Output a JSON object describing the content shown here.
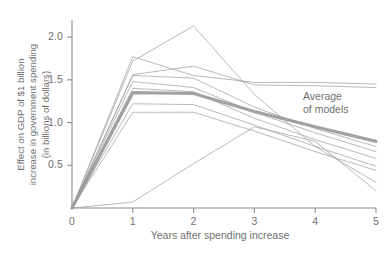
{
  "chart_data": {
    "type": "line",
    "title": "",
    "subtitle": "",
    "xlabel": "Years after spending increase",
    "ylabel": "Effect on GDP of $1 billion\nincrease in government spending\n(in billions of dollars)",
    "xlim": [
      0,
      5
    ],
    "ylim": [
      0,
      2.2
    ],
    "xticks": [
      "0",
      "1",
      "2",
      "3",
      "4",
      "5"
    ],
    "yticks": [
      "0.5",
      "1.0",
      "1.5",
      "2.0"
    ],
    "ytick_values": [
      0.5,
      1.0,
      1.5,
      2.0
    ],
    "xtick_values": [
      0,
      1,
      2,
      3,
      4,
      5
    ],
    "grid": false,
    "legend_position": "annotation-right",
    "x": [
      0,
      1,
      2,
      3,
      4,
      5
    ],
    "series": [
      {
        "name": "Model 1",
        "values": [
          0,
          1.72,
          2.13,
          1.33,
          0.72,
          0.3
        ],
        "style": "thin"
      },
      {
        "name": "Model 2",
        "values": [
          0,
          1.77,
          1.55,
          1.47,
          1.47,
          1.45
        ],
        "style": "thin"
      },
      {
        "name": "Model 3",
        "values": [
          0,
          1.56,
          1.66,
          1.44,
          1.43,
          1.41
        ],
        "style": "thin"
      },
      {
        "name": "Model 4",
        "values": [
          0,
          1.55,
          1.52,
          1.18,
          0.93,
          0.72
        ],
        "style": "thin"
      },
      {
        "name": "Model 5",
        "values": [
          0,
          1.48,
          1.41,
          1.12,
          0.88,
          0.66
        ],
        "style": "thin"
      },
      {
        "name": "Model 6",
        "values": [
          0,
          1.4,
          1.36,
          1.05,
          0.8,
          0.58
        ],
        "style": "thin"
      },
      {
        "name": "Model 7",
        "values": [
          0,
          1.22,
          1.21,
          0.97,
          0.72,
          0.49
        ],
        "style": "thin"
      },
      {
        "name": "Model 8",
        "values": [
          0,
          1.12,
          1.12,
          0.9,
          0.66,
          0.44
        ],
        "style": "thin"
      },
      {
        "name": "Model 9",
        "values": [
          0,
          0.07,
          0.52,
          0.95,
          0.78,
          0.2
        ],
        "style": "thin"
      },
      {
        "name": "Average of models",
        "values": [
          0,
          1.35,
          1.34,
          1.13,
          0.95,
          0.78
        ],
        "style": "thick"
      }
    ],
    "annotations": [
      {
        "name": "average-of-models",
        "text": "Average\nof models",
        "x": 4.2,
        "y": 1.22
      }
    ],
    "colors": {
      "line": "#9a9a9a",
      "average_line": "#9a9a9a",
      "axis": "#8c8c8c",
      "text": "#6f6f6f",
      "background": "#ffffff"
    }
  }
}
